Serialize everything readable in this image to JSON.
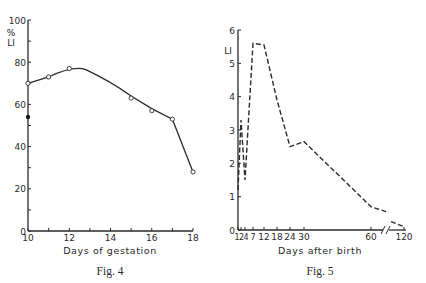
{
  "chart_data": [
    {
      "type": "line",
      "caption": "Fig. 4",
      "title": "",
      "xlabel": "Days of gestation",
      "ylabel": "% LI",
      "ylabel_lines": [
        "%",
        "LI"
      ],
      "xlim": [
        10,
        18
      ],
      "ylim": [
        0,
        100
      ],
      "x_ticks": [
        10,
        11,
        12,
        13,
        14,
        15,
        16,
        17,
        18
      ],
      "x_tick_labels": [
        "10",
        "12",
        "14",
        "16",
        "18"
      ],
      "y_ticks": [
        0,
        10,
        20,
        30,
        40,
        50,
        60,
        70,
        80,
        90,
        100
      ],
      "y_tick_labels": [
        "0",
        "20",
        "40",
        "60",
        "80",
        "100"
      ],
      "grid": false,
      "series": [
        {
          "name": "open circles (smoothed curve)",
          "marker": "open-circle",
          "line": "solid",
          "x": [
            10,
            11,
            12,
            15,
            16,
            17,
            18
          ],
          "y": [
            70,
            73,
            77,
            63,
            57,
            53,
            28
          ]
        },
        {
          "name": "filled circle",
          "marker": "filled-circle",
          "line": "none",
          "x": [
            10
          ],
          "y": [
            54
          ]
        }
      ]
    },
    {
      "type": "line",
      "caption": "Fig. 5",
      "title": "",
      "xlabel": "Days after birth",
      "ylabel": "LI",
      "xlim": [
        1,
        120
      ],
      "ylim": [
        0,
        6
      ],
      "x_ticks": [
        1,
        2,
        4,
        7,
        12,
        18,
        24,
        30,
        60,
        120
      ],
      "x_tick_labels": [
        "1",
        "2",
        "4",
        "7",
        "12",
        "18",
        "24",
        "30",
        "60",
        "120"
      ],
      "x_axis_break": "between 60 and 120",
      "y_ticks": [
        0,
        1,
        2,
        3,
        4,
        5,
        6
      ],
      "y_tick_labels": [
        "0",
        "1",
        "2",
        "3",
        "4",
        "5",
        "6"
      ],
      "grid": false,
      "series": [
        {
          "name": "LI after birth",
          "marker": "none",
          "line": "dashed",
          "x": [
            1,
            2,
            4,
            7,
            12,
            18,
            24,
            30,
            60,
            80,
            100,
            120
          ],
          "y": [
            1.2,
            3.3,
            1.5,
            5.6,
            5.55,
            3.9,
            2.5,
            2.65,
            0.7,
            0.55,
            0.25,
            0.1
          ]
        }
      ]
    }
  ]
}
